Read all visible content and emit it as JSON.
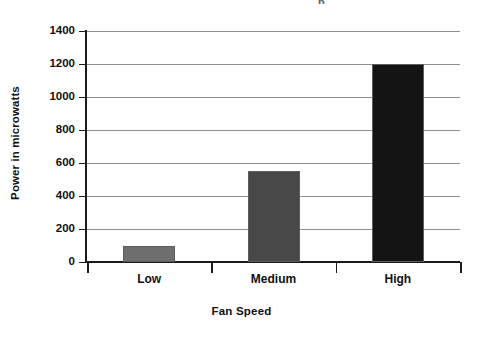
{
  "chart_data": {
    "type": "bar",
    "title": "",
    "title_fragment": "p",
    "categories": [
      "Low",
      "Medium",
      "High"
    ],
    "values": [
      100,
      550,
      1200
    ],
    "series": [
      {
        "name": "Power",
        "values": [
          100,
          550,
          1200
        ]
      }
    ],
    "xlabel": "Fan Speed",
    "ylabel": "Power in microwatts",
    "ylim": [
      0,
      1400
    ],
    "yticks": [
      0,
      200,
      400,
      600,
      800,
      1000,
      1200,
      1400
    ],
    "ytick_labels": [
      "0",
      "200",
      "400",
      "600",
      "800",
      "1000",
      "1200",
      "1400"
    ],
    "grid": true,
    "grid_axis": "y",
    "legend": false,
    "legend_position": "none",
    "bar_colors": [
      "#6e6e6e",
      "#484848",
      "#141414"
    ],
    "bar_edge_color": "#5d5d5d",
    "axis_color": "#1b1b1b",
    "gridline_color": "#8e8e8e",
    "background": "#ffffff",
    "text_color": "#111111"
  },
  "axis": {
    "y_title": "Power in microwatts",
    "x_title": "Fan Speed"
  }
}
